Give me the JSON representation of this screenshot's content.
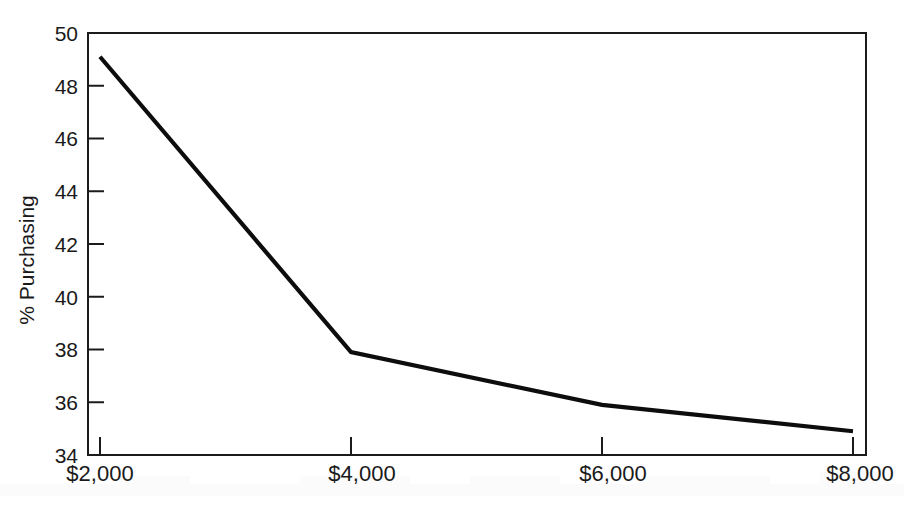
{
  "chart_data": {
    "type": "line",
    "title": "",
    "subtitle": "",
    "xlabel": "",
    "ylabel": "% Purchasing",
    "categories": [
      "$2,000",
      "$4,000",
      "$6,000",
      "$8,000"
    ],
    "x": [
      2000,
      4000,
      6000,
      8000
    ],
    "values": [
      49.1,
      37.9,
      35.9,
      34.9
    ],
    "series": [
      {
        "name": "% Purchasing",
        "values": [
          49.1,
          37.9,
          35.9,
          34.9
        ]
      }
    ],
    "ylim": [
      34,
      50
    ],
    "xlim": [
      2000,
      8000
    ],
    "y_ticks": [
      34,
      36,
      38,
      40,
      42,
      44,
      46,
      48,
      50
    ],
    "y_tick_labels": [
      "34",
      "36",
      "38",
      "40",
      "42",
      "44",
      "46",
      "48",
      "50"
    ],
    "x_ticks": [
      2000,
      4000,
      6000,
      8000
    ],
    "x_tick_labels": [
      "$2,000",
      "$4,000",
      "$6,000",
      "$8,000"
    ],
    "grid": false,
    "legend": false,
    "legend_position": "none",
    "line_color": "#0d0d0d",
    "frame_color": "#1b1b1b",
    "background_color": "#ffffff",
    "annotations": []
  },
  "axes": {
    "y_title": "% Purchasing",
    "y_labels": [
      "50",
      "48",
      "46",
      "44",
      "42",
      "40",
      "38",
      "36",
      "34"
    ],
    "x_labels": [
      "$2,000",
      "$4,000",
      "$6,000",
      "$8,000"
    ]
  }
}
